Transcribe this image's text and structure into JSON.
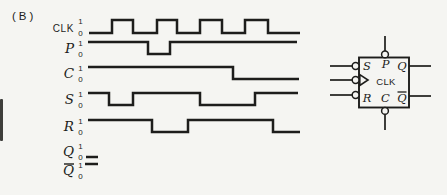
{
  "figure": {
    "label": "(B)"
  },
  "colors": {
    "ink": "#1d1d1b",
    "paper": "#f5f5f2"
  },
  "chart_data": {
    "type": "timing-diagram",
    "signals": [
      {
        "id": "clk",
        "label": "CLK",
        "label_style": "sans",
        "overbar": false,
        "tick_high": "1",
        "tick_low": "0",
        "high_y": 20,
        "low_y": 33,
        "segments": [
          {
            "x1": 89,
            "x2": 112,
            "level": 0
          },
          {
            "x1": 112,
            "x2": 133,
            "level": 1
          },
          {
            "x1": 133,
            "x2": 157,
            "level": 0
          },
          {
            "x1": 157,
            "x2": 177,
            "level": 1
          },
          {
            "x1": 177,
            "x2": 200,
            "level": 0
          },
          {
            "x1": 200,
            "x2": 222,
            "level": 1
          },
          {
            "x1": 222,
            "x2": 245,
            "level": 0
          },
          {
            "x1": 245,
            "x2": 268,
            "level": 1
          },
          {
            "x1": 268,
            "x2": 300,
            "level": 0
          }
        ]
      },
      {
        "id": "p",
        "label": "P",
        "label_style": "serif-italic",
        "overbar": false,
        "tick_high": "1",
        "tick_low": "0",
        "high_y": 42,
        "low_y": 54,
        "segments": [
          {
            "x1": 88,
            "x2": 148,
            "level": 1
          },
          {
            "x1": 148,
            "x2": 170,
            "level": 0
          },
          {
            "x1": 170,
            "x2": 297,
            "level": 1
          }
        ]
      },
      {
        "id": "c",
        "label": "C",
        "label_style": "serif-italic",
        "overbar": false,
        "tick_high": "1",
        "tick_low": "0",
        "high_y": 67,
        "low_y": 79,
        "segments": [
          {
            "x1": 88,
            "x2": 233,
            "level": 1
          },
          {
            "x1": 233,
            "x2": 299,
            "level": 0
          }
        ]
      },
      {
        "id": "s",
        "label": "S",
        "label_style": "serif-italic",
        "overbar": false,
        "tick_high": "1",
        "tick_low": "0",
        "high_y": 93,
        "low_y": 105,
        "segments": [
          {
            "x1": 88,
            "x2": 109,
            "level": 1
          },
          {
            "x1": 109,
            "x2": 133,
            "level": 0
          },
          {
            "x1": 133,
            "x2": 200,
            "level": 1
          },
          {
            "x1": 200,
            "x2": 255,
            "level": 0
          },
          {
            "x1": 255,
            "x2": 298,
            "level": 1
          }
        ]
      },
      {
        "id": "r",
        "label": "R",
        "label_style": "serif-italic",
        "overbar": false,
        "tick_high": "1",
        "tick_low": "0",
        "high_y": 120,
        "low_y": 132,
        "segments": [
          {
            "x1": 88,
            "x2": 152,
            "level": 1
          },
          {
            "x1": 152,
            "x2": 188,
            "level": 0
          },
          {
            "x1": 188,
            "x2": 273,
            "level": 1
          },
          {
            "x1": 273,
            "x2": 300,
            "level": 0
          }
        ]
      },
      {
        "id": "q",
        "label": "Q",
        "label_style": "serif-italic",
        "overbar": false,
        "tick_high": "1",
        "tick_low": "0",
        "high_y": 145,
        "low_y": 157,
        "segments": [
          {
            "x1": 86,
            "x2": 98,
            "level": 0
          }
        ]
      },
      {
        "id": "qbar",
        "label": "Q",
        "label_style": "serif-italic",
        "overbar": true,
        "tick_high": "1",
        "tick_low": "0",
        "high_y": 164,
        "low_y": 176,
        "segments": [
          {
            "x1": 85,
            "x2": 98,
            "level": 1
          }
        ]
      }
    ],
    "layout": {
      "label_x": 74,
      "tick_x": 80.5
    }
  },
  "symbol": {
    "box": {
      "x": 359,
      "y": 57.5,
      "w": 50,
      "h": 50
    },
    "bubble_r": 3.4,
    "pins": {
      "top": {
        "name": "p",
        "x": 385,
        "line_y1": 36,
        "line_y2": 51,
        "bubble_cy": 54.4
      },
      "bottom": {
        "name": "c",
        "x": 385,
        "bubble_cy": 110.9,
        "line_y1": 114.5,
        "line_y2": 130
      },
      "left_line_x1": 330,
      "left_line_x2": 352.2,
      "left_bubble_cx": 355.6,
      "left": [
        {
          "name": "s",
          "y": 66
        },
        {
          "name": "clk",
          "y": 80,
          "clock": true
        },
        {
          "name": "r",
          "y": 95
        }
      ],
      "right_line_x1": 409,
      "right_line_x2": 431,
      "right": [
        {
          "name": "q",
          "y": 66
        },
        {
          "name": "qbar",
          "y": 96
        }
      ]
    },
    "clock_triangle": "359.8,74.6 368,80 359.8,85.4",
    "labels": [
      {
        "text": "S",
        "x": 367,
        "y": 70,
        "style": "serif-italic"
      },
      {
        "text": "P",
        "x": 385.5,
        "y": 68,
        "style": "serif-italic"
      },
      {
        "text": "Q",
        "x": 402,
        "y": 70,
        "style": "serif-italic"
      },
      {
        "text": "CLK",
        "x": 386,
        "y": 84.5,
        "style": "sans"
      },
      {
        "text": "R",
        "x": 367,
        "y": 101.5,
        "style": "serif-italic"
      },
      {
        "text": "C",
        "x": 385.5,
        "y": 101.5,
        "style": "serif-italic"
      },
      {
        "text": "Q",
        "x": 402,
        "y": 101.5,
        "style": "serif-italic",
        "overbar": true
      }
    ]
  }
}
